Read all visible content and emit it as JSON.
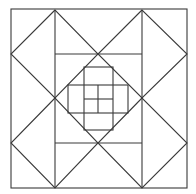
{
  "diagram": {
    "title": "",
    "stroke_color": "#3a3a3a",
    "background": "#ffffff",
    "outer_square": {
      "x": 11,
      "y": 9,
      "w": 176,
      "h": 179
    },
    "diamonds": [
      {
        "name": "top-left",
        "points": "55,10 11,54 55,98 98,54"
      },
      {
        "name": "top-right",
        "points": "142,10 98,54 142,98 187,54"
      },
      {
        "name": "bottom-left",
        "points": "55,98 11,143 55,188 98,143"
      },
      {
        "name": "bottom-right",
        "points": "142,98 98,143 142,188 187,143"
      }
    ],
    "lines": [
      {
        "x1": 55,
        "y1": 10,
        "x2": 55,
        "y2": 188
      },
      {
        "x1": 142,
        "y1": 10,
        "x2": 142,
        "y2": 188
      },
      {
        "x1": 55,
        "y1": 54,
        "x2": 142,
        "y2": 54
      },
      {
        "x1": 55,
        "y1": 143,
        "x2": 142,
        "y2": 143
      },
      {
        "x1": 98,
        "y1": 85,
        "x2": 98,
        "y2": 113
      },
      {
        "x1": 84,
        "y1": 99,
        "x2": 113,
        "y2": 99
      }
    ],
    "inner_rects": [
      {
        "name": "vertical-band",
        "x": 84,
        "y": 67,
        "w": 29,
        "h": 63
      },
      {
        "name": "horizontal-band",
        "x": 68,
        "y": 85,
        "w": 60,
        "h": 28
      }
    ]
  }
}
